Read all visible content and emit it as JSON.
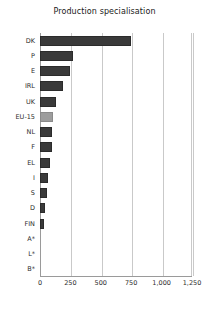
{
  "chart_data": {
    "type": "bar",
    "orientation": "horizontal",
    "title": "Production specialisation",
    "xlabel": "",
    "ylabel": "",
    "categories": [
      "DK",
      "P",
      "E",
      "IRL",
      "UK",
      "EU-15",
      "NL",
      "F",
      "EL",
      "I",
      "S",
      "D",
      "FIN",
      "A*",
      "L*",
      "B*"
    ],
    "values": [
      745,
      270,
      250,
      190,
      130,
      108,
      100,
      95,
      80,
      68,
      55,
      38,
      30,
      0,
      0,
      0
    ],
    "series": [
      {
        "name": "Production specialisation",
        "values": [
          745,
          270,
          250,
          190,
          130,
          108,
          100,
          95,
          80,
          68,
          55,
          38,
          30,
          0,
          0,
          0
        ]
      }
    ],
    "highlight_category": "EU-15",
    "xlim": [
      0,
      1250
    ],
    "xticks": [
      0,
      250,
      500,
      750,
      1000,
      1250
    ],
    "xtick_labels": [
      "0",
      "250",
      "500",
      "750",
      "1,000",
      "1,250"
    ],
    "grid": "vertical",
    "legend": "none",
    "bar_color": "#3a3a3a",
    "highlight_color": "#9d9d9d",
    "gridline_color": "#c9c9c9",
    "axis_color": "#9a9a9a",
    "background": "#ffffff"
  }
}
